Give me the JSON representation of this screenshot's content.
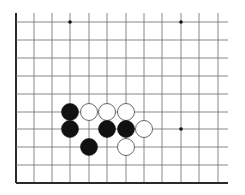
{
  "board": {
    "background": "#ffffff",
    "line_color": "#6a6a6a",
    "edge_color": "#2a2a2a",
    "columns_x": [
      16,
      34,
      52,
      70,
      89,
      107,
      126,
      144,
      162,
      181,
      199,
      218
    ],
    "rows_y": [
      22,
      40,
      58,
      76,
      94,
      112,
      129,
      147,
      165,
      183
    ],
    "top_extend_to": 13,
    "right_extend_to": 228,
    "left_edge": true,
    "bottom_edge": true,
    "star_points": [
      {
        "col": 3,
        "row": 0
      },
      {
        "col": 9,
        "row": 0
      },
      {
        "col": 9,
        "row": 6
      }
    ],
    "stone_radius": 8.5,
    "stones": [
      {
        "color": "black",
        "col": 3,
        "row": 5
      },
      {
        "color": "white",
        "col": 4,
        "row": 5
      },
      {
        "color": "white",
        "col": 5,
        "row": 5
      },
      {
        "color": "white",
        "col": 6,
        "row": 5
      },
      {
        "color": "black",
        "col": 3,
        "row": 6
      },
      {
        "color": "black",
        "col": 5,
        "row": 6
      },
      {
        "color": "black",
        "col": 6,
        "row": 6
      },
      {
        "color": "white",
        "col": 7,
        "row": 6
      },
      {
        "color": "black",
        "col": 4,
        "row": 7
      },
      {
        "color": "white",
        "col": 6,
        "row": 7
      }
    ]
  }
}
